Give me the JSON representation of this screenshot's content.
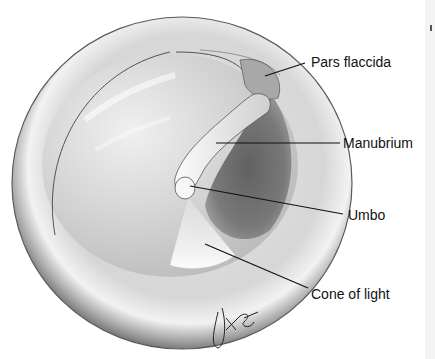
{
  "figure": {
    "signature": "JKG"
  },
  "labels": [
    {
      "id": "pars-flaccida",
      "text": "Pars flaccida"
    },
    {
      "id": "manubrium",
      "text": "Manubrium"
    },
    {
      "id": "umbo",
      "text": "Umbo"
    },
    {
      "id": "cone-of-light",
      "text": "Cone of light"
    }
  ]
}
